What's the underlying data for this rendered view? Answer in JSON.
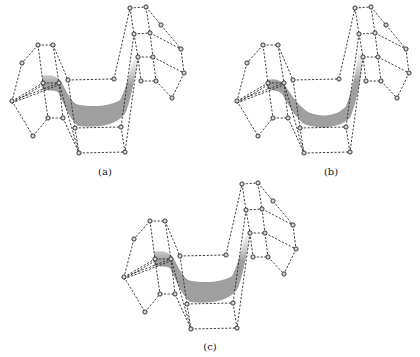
{
  "figure": {
    "panels": [
      {
        "id": "a",
        "label": "(a)",
        "offset": [
          0,
          0
        ],
        "label_pos": [
          105,
          175
        ],
        "band": "a"
      },
      {
        "id": "b",
        "label": "(b)",
        "offset": [
          225,
          0
        ],
        "label_pos": [
          331,
          175
        ],
        "band": "b"
      },
      {
        "id": "c",
        "label": "(c)",
        "offset": [
          112,
          176
        ],
        "label_pos": [
          210,
          350
        ],
        "band": "c"
      }
    ],
    "control_net": {
      "vertices": {
        "A1": [
          38,
          45
        ],
        "A2": [
          53,
          45
        ],
        "L1": [
          22,
          63
        ],
        "J": [
          12,
          101
        ],
        "M1": [
          43,
          83
        ],
        "M2": [
          59,
          83
        ],
        "N": [
          68,
          80
        ],
        "P": [
          114,
          79
        ],
        "B1": [
          48,
          118
        ],
        "B2": [
          63,
          118
        ],
        "C": [
          33,
          136
        ],
        "E1": [
          75,
          128
        ],
        "E2": [
          121,
          127
        ],
        "F1": [
          79,
          153
        ],
        "F2": [
          125,
          152
        ],
        "R1": [
          130,
          8
        ],
        "R2": [
          146,
          7
        ],
        "R3": [
          161,
          25
        ],
        "R5": [
          181,
          49
        ],
        "R7": [
          184,
          73
        ],
        "R9": [
          172,
          98
        ],
        "S1": [
          134,
          34
        ],
        "S2": [
          150,
          33
        ],
        "T1": [
          138,
          57
        ],
        "T2": [
          153,
          57
        ],
        "U1": [
          141,
          81
        ],
        "U2": [
          156,
          81
        ]
      },
      "edges": [
        [
          "A1",
          "A2"
        ],
        [
          "A1",
          "L1"
        ],
        [
          "L1",
          "J"
        ],
        [
          "A1",
          "M1"
        ],
        [
          "A2",
          "M2"
        ],
        [
          "A2",
          "N"
        ],
        [
          "J",
          "M1"
        ],
        [
          "J",
          "M2"
        ],
        [
          "M1",
          "M2"
        ],
        [
          "M1",
          "B1"
        ],
        [
          "M2",
          "B2"
        ],
        [
          "B1",
          "B2"
        ],
        [
          "J",
          "C"
        ],
        [
          "C",
          "B1"
        ],
        [
          "N",
          "P"
        ],
        [
          "N",
          "E1"
        ],
        [
          "M2",
          "F1"
        ],
        [
          "B2",
          "F1"
        ],
        [
          "E1",
          "E2"
        ],
        [
          "F1",
          "F2"
        ],
        [
          "E1",
          "F1"
        ],
        [
          "E2",
          "F2"
        ],
        [
          "P",
          "R1"
        ],
        [
          "S1",
          "E2"
        ],
        [
          "T1",
          "F2"
        ],
        [
          "R1",
          "R2"
        ],
        [
          "R2",
          "R3"
        ],
        [
          "R3",
          "R5"
        ],
        [
          "R5",
          "R7"
        ],
        [
          "R7",
          "R9"
        ],
        [
          "R1",
          "S1"
        ],
        [
          "R2",
          "S2"
        ],
        [
          "S1",
          "S2"
        ],
        [
          "S2",
          "R5"
        ],
        [
          "S1",
          "T1"
        ],
        [
          "S2",
          "T2"
        ],
        [
          "T1",
          "T2"
        ],
        [
          "T2",
          "R7"
        ],
        [
          "T1",
          "U1"
        ],
        [
          "T2",
          "U2"
        ],
        [
          "U1",
          "U2"
        ],
        [
          "U2",
          "R9"
        ]
      ],
      "double_edges": [
        [
          "J",
          "M1"
        ],
        [
          "J",
          "M2"
        ]
      ]
    },
    "bands": {
      "a": {
        "path": "M42,76 C50,74 56,76 60,80 C66,90 70,100 76,104 C90,108 112,106 120,100 C126,90 130,70 136,50 L139,52 C136,72 132,96 126,112 C118,126 96,128 78,126 C70,120 64,104 58,92 C54,90 48,91 42,90 Z",
        "color": "#9a9a9a"
      },
      "b": {
        "path": "M267,80 C274,78 280,80 284,84 C290,92 296,104 308,112 C322,118 338,116 346,106 C352,92 356,70 360,44 L364,46 C362,72 358,100 350,118 C340,128 320,130 304,124 C294,116 288,104 282,94 C278,90 272,90 267,89 Z",
        "color": "#9a9a9a"
      },
      "c": {
        "path": "M154,252 C162,250 168,252 172,256 C178,266 182,276 188,280 C202,284 224,282 232,276 C238,266 242,246 248,226 L251,228 C248,248 244,272 238,288 C230,302 208,304 190,302 C182,296 176,280 170,268 C166,266 160,267 154,266 Z",
        "color": "#9a9a9a"
      }
    }
  }
}
